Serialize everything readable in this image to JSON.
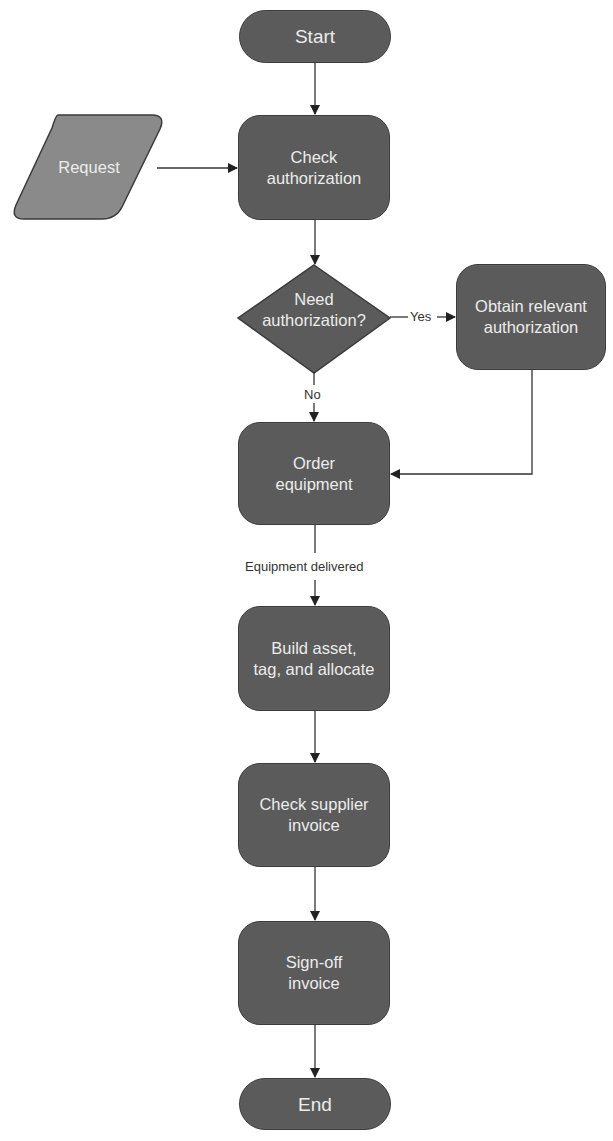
{
  "diagram": {
    "type": "flowchart",
    "colors": {
      "node_fill": "#5b5b5b",
      "input_fill": "#8a8a8a",
      "node_border": "#3a3a3a",
      "node_text": "#ececec",
      "edge": "#333333"
    },
    "nodes": {
      "start": {
        "label": "Start",
        "shape": "terminal"
      },
      "request": {
        "label": "Request",
        "shape": "parallelogram"
      },
      "check_authorization": {
        "label": "Check\nauthorization",
        "shape": "process"
      },
      "need_authorization": {
        "label": "Need\nauthorization?",
        "shape": "decision"
      },
      "obtain_authorization": {
        "label": "Obtain relevant\nauthorization",
        "shape": "process"
      },
      "order_equipment": {
        "label": "Order\nequipment",
        "shape": "process"
      },
      "build_asset": {
        "label": "Build asset,\ntag, and allocate",
        "shape": "process"
      },
      "check_supplier_invoice": {
        "label": "Check supplier\ninvoice",
        "shape": "process"
      },
      "signoff_invoice": {
        "label": "Sign-off\ninvoice",
        "shape": "process"
      },
      "end": {
        "label": "End",
        "shape": "terminal"
      }
    },
    "edges": [
      {
        "from": "start",
        "to": "check_authorization",
        "label": ""
      },
      {
        "from": "request",
        "to": "check_authorization",
        "label": ""
      },
      {
        "from": "check_authorization",
        "to": "need_authorization",
        "label": ""
      },
      {
        "from": "need_authorization",
        "to": "obtain_authorization",
        "label": "Yes"
      },
      {
        "from": "need_authorization",
        "to": "order_equipment",
        "label": "No"
      },
      {
        "from": "obtain_authorization",
        "to": "order_equipment",
        "label": ""
      },
      {
        "from": "order_equipment",
        "to": "build_asset",
        "label": "Equipment delivered"
      },
      {
        "from": "build_asset",
        "to": "check_supplier_invoice",
        "label": ""
      },
      {
        "from": "check_supplier_invoice",
        "to": "signoff_invoice",
        "label": ""
      },
      {
        "from": "signoff_invoice",
        "to": "end",
        "label": ""
      }
    ],
    "edge_labels": {
      "yes": "Yes",
      "no": "No",
      "equipment_delivered": "Equipment delivered"
    }
  }
}
